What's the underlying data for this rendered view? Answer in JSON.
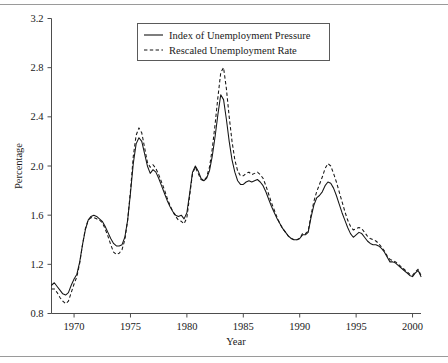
{
  "chart_data": {
    "type": "line",
    "title": "",
    "xlabel": "Year",
    "ylabel": "Percentage",
    "xlim": [
      1968.0,
      2000.75
    ],
    "ylim": [
      0.8,
      3.2
    ],
    "xticks": [
      1970,
      1975,
      1980,
      1985,
      1990,
      1995,
      2000
    ],
    "yticks": [
      0.8,
      1.2,
      1.6,
      2.0,
      2.4,
      2.8,
      3.2
    ],
    "xtick_labels": [
      "1970",
      "1975",
      "1980",
      "1985",
      "1990",
      "1995",
      "2000"
    ],
    "ytick_labels": [
      "0.8",
      "1.2",
      "1.6",
      "2.0",
      "2.4",
      "2.8",
      "3.2"
    ],
    "grid": false,
    "legend_position": "top-center",
    "x": [
      1968.0,
      1968.25,
      1968.5,
      1968.75,
      1969.0,
      1969.25,
      1969.5,
      1969.75,
      1970.0,
      1970.25,
      1970.5,
      1970.75,
      1971.0,
      1971.25,
      1971.5,
      1971.75,
      1972.0,
      1972.25,
      1972.5,
      1972.75,
      1973.0,
      1973.25,
      1973.5,
      1973.75,
      1974.0,
      1974.25,
      1974.5,
      1974.75,
      1975.0,
      1975.25,
      1975.5,
      1975.75,
      1976.0,
      1976.25,
      1976.5,
      1976.75,
      1977.0,
      1977.25,
      1977.5,
      1977.75,
      1978.0,
      1978.25,
      1978.5,
      1978.75,
      1979.0,
      1979.25,
      1979.5,
      1979.75,
      1980.0,
      1980.25,
      1980.5,
      1980.75,
      1981.0,
      1981.25,
      1981.5,
      1981.75,
      1982.0,
      1982.25,
      1982.5,
      1982.75,
      1983.0,
      1983.25,
      1983.5,
      1983.75,
      1984.0,
      1984.25,
      1984.5,
      1984.75,
      1985.0,
      1985.25,
      1985.5,
      1985.75,
      1986.0,
      1986.25,
      1986.5,
      1986.75,
      1987.0,
      1987.25,
      1987.5,
      1987.75,
      1988.0,
      1988.25,
      1988.5,
      1988.75,
      1989.0,
      1989.25,
      1989.5,
      1989.75,
      1990.0,
      1990.25,
      1990.5,
      1990.75,
      1991.0,
      1991.25,
      1991.5,
      1991.75,
      1992.0,
      1992.25,
      1992.5,
      1992.75,
      1993.0,
      1993.25,
      1993.5,
      1993.75,
      1994.0,
      1994.25,
      1994.5,
      1994.75,
      1995.0,
      1995.25,
      1995.5,
      1995.75,
      1996.0,
      1996.25,
      1996.5,
      1996.75,
      1997.0,
      1997.25,
      1997.5,
      1997.75,
      1998.0,
      1998.25,
      1998.5,
      1998.75,
      1999.0,
      1999.25,
      1999.5,
      1999.75,
      2000.0,
      2000.25,
      2000.5,
      2000.75
    ],
    "series": [
      {
        "name": "Index of Unemployment Pressure",
        "style": "solid",
        "values": [
          1.03,
          1.05,
          1.02,
          0.99,
          0.96,
          0.95,
          0.97,
          1.03,
          1.08,
          1.12,
          1.22,
          1.36,
          1.48,
          1.56,
          1.59,
          1.6,
          1.59,
          1.57,
          1.55,
          1.51,
          1.46,
          1.41,
          1.37,
          1.35,
          1.35,
          1.36,
          1.42,
          1.56,
          1.78,
          2.02,
          2.18,
          2.23,
          2.2,
          2.1,
          2.0,
          1.94,
          1.97,
          1.95,
          1.9,
          1.84,
          1.78,
          1.72,
          1.67,
          1.63,
          1.6,
          1.59,
          1.6,
          1.57,
          1.62,
          1.78,
          1.95,
          2.0,
          1.96,
          1.9,
          1.88,
          1.9,
          1.96,
          2.08,
          2.24,
          2.42,
          2.58,
          2.54,
          2.38,
          2.2,
          2.05,
          1.95,
          1.88,
          1.85,
          1.85,
          1.87,
          1.88,
          1.87,
          1.88,
          1.89,
          1.87,
          1.84,
          1.79,
          1.73,
          1.67,
          1.62,
          1.57,
          1.53,
          1.49,
          1.46,
          1.43,
          1.41,
          1.4,
          1.4,
          1.41,
          1.44,
          1.44,
          1.46,
          1.58,
          1.68,
          1.74,
          1.76,
          1.79,
          1.84,
          1.87,
          1.86,
          1.82,
          1.76,
          1.69,
          1.62,
          1.56,
          1.5,
          1.45,
          1.42,
          1.44,
          1.46,
          1.45,
          1.42,
          1.39,
          1.37,
          1.36,
          1.36,
          1.35,
          1.33,
          1.3,
          1.26,
          1.22,
          1.22,
          1.21,
          1.19,
          1.17,
          1.15,
          1.13,
          1.11,
          1.1,
          1.13,
          1.15,
          1.1
        ]
      },
      {
        "name": "Rescaled Unemployment Rate",
        "style": "dashed",
        "values": [
          1.0,
          1.0,
          0.97,
          0.93,
          0.9,
          0.88,
          0.9,
          0.97,
          1.04,
          1.1,
          1.21,
          1.36,
          1.49,
          1.56,
          1.58,
          1.58,
          1.57,
          1.56,
          1.54,
          1.49,
          1.43,
          1.36,
          1.3,
          1.28,
          1.29,
          1.32,
          1.4,
          1.56,
          1.8,
          2.08,
          2.25,
          2.31,
          2.27,
          2.15,
          2.03,
          1.99,
          2.01,
          1.98,
          1.93,
          1.87,
          1.81,
          1.74,
          1.68,
          1.63,
          1.59,
          1.56,
          1.55,
          1.53,
          1.58,
          1.76,
          1.94,
          1.99,
          1.94,
          1.89,
          1.88,
          1.91,
          1.99,
          2.14,
          2.34,
          2.56,
          2.76,
          2.8,
          2.63,
          2.4,
          2.2,
          2.05,
          1.96,
          1.92,
          1.92,
          1.94,
          1.95,
          1.93,
          1.94,
          1.95,
          1.93,
          1.9,
          1.84,
          1.77,
          1.7,
          1.64,
          1.58,
          1.53,
          1.49,
          1.46,
          1.43,
          1.41,
          1.4,
          1.4,
          1.41,
          1.45,
          1.45,
          1.47,
          1.6,
          1.71,
          1.79,
          1.85,
          1.91,
          1.98,
          2.02,
          2.0,
          1.94,
          1.87,
          1.79,
          1.71,
          1.63,
          1.56,
          1.51,
          1.48,
          1.49,
          1.5,
          1.49,
          1.46,
          1.43,
          1.41,
          1.4,
          1.39,
          1.37,
          1.34,
          1.31,
          1.27,
          1.24,
          1.23,
          1.22,
          1.2,
          1.18,
          1.16,
          1.14,
          1.12,
          1.11,
          1.14,
          1.16,
          1.11
        ]
      }
    ]
  },
  "legend": {
    "entries": [
      {
        "label": "Index of Unemployment Pressure",
        "style": "solid"
      },
      {
        "label": "Rescaled Unemployment Rate",
        "style": "dashed"
      }
    ]
  },
  "axes": {
    "y_title": "Percentage",
    "x_title": "Year"
  }
}
